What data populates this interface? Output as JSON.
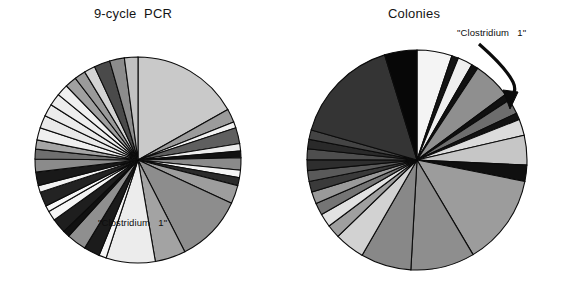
{
  "figure": {
    "background": "#ffffff",
    "stroke_color": "#0b0b0b",
    "width": 563,
    "height": 287
  },
  "panels": {
    "left": {
      "title": "9-cycle  PCR",
      "highlight_label": "\"Clostridium   1\""
    },
    "right": {
      "title": "Colonies",
      "highlight_label": "\"Clostridium   1\"",
      "annotation_arrow": "curved-arrow-icon"
    }
  },
  "chart_data": [
    {
      "type": "pie",
      "title": "9-cycle  PCR",
      "panel": "left",
      "center": [
        138,
        160
      ],
      "radius": 103,
      "start_angle_deg": -90,
      "direction": "clockwise",
      "annotations": [
        {
          "text": "\"Clostridium   1\"",
          "target_slice": "Clostridium 1",
          "x": 155,
          "y": 228
        }
      ],
      "legend": "none",
      "grid": false,
      "slices": [
        {
          "label": "Clostridium 1",
          "value": 17.5,
          "color": "#c9c9c9"
        },
        {
          "label": "clone 2",
          "value": 2.2,
          "color": "#9b9b9b"
        },
        {
          "label": "clone 3",
          "value": 1.0,
          "color": "#f2f2f2"
        },
        {
          "label": "clone 4",
          "value": 2.6,
          "color": "#5f5f5f"
        },
        {
          "label": "clone 5",
          "value": 1.2,
          "color": "#ededed"
        },
        {
          "label": "clone 6",
          "value": 1.1,
          "color": "#121212"
        },
        {
          "label": "clone 7",
          "value": 2.0,
          "color": "#8a8a8a"
        },
        {
          "label": "clone 8",
          "value": 1.2,
          "color": "#f4f4f4"
        },
        {
          "label": "clone 9",
          "value": 1.3,
          "color": "#2b2b2b"
        },
        {
          "label": "clone 10",
          "value": 3.0,
          "color": "#9d9d9d"
        },
        {
          "label": "clone 11",
          "value": 11.0,
          "color": "#8d8d8d"
        },
        {
          "label": "clone 12",
          "value": 5.0,
          "color": "#a3a3a3"
        },
        {
          "label": "clone 13",
          "value": 8.0,
          "color": "#ececec"
        },
        {
          "label": "clone 14",
          "value": 1.2,
          "color": "#f6f6f6"
        },
        {
          "label": "clone 15",
          "value": 2.6,
          "color": "#1b1b1b"
        },
        {
          "label": "clone 16",
          "value": 3.2,
          "color": "#8f8f8f"
        },
        {
          "label": "clone 17",
          "value": 1.1,
          "color": "#111111"
        },
        {
          "label": "clone 18",
          "value": 2.4,
          "color": "#1e1e1e"
        },
        {
          "label": "clone 19",
          "value": 1.6,
          "color": "#f5f5f5"
        },
        {
          "label": "clone 20",
          "value": 1.0,
          "color": "#f7f7f7"
        },
        {
          "label": "clone 21",
          "value": 2.4,
          "color": "#232323"
        },
        {
          "label": "clone 22",
          "value": 1.1,
          "color": "#f2f2f2"
        },
        {
          "label": "clone 23",
          "value": 2.2,
          "color": "#191919"
        },
        {
          "label": "clone 24",
          "value": 2.1,
          "color": "#8b8b8b"
        },
        {
          "label": "clone 25",
          "value": 1.6,
          "color": "#6f6f6f"
        },
        {
          "label": "clone 26",
          "value": 1.5,
          "color": "#a5a5a5"
        },
        {
          "label": "clone 27",
          "value": 2.0,
          "color": "#efefef"
        },
        {
          "label": "clone 28",
          "value": 2.1,
          "color": "#e9e9e9"
        },
        {
          "label": "clone 29",
          "value": 2.0,
          "color": "#ebebeb"
        },
        {
          "label": "clone 30",
          "value": 2.0,
          "color": "#ededed"
        },
        {
          "label": "clone 31",
          "value": 1.9,
          "color": "#f0f0f0"
        },
        {
          "label": "clone 32",
          "value": 1.9,
          "color": "#a0a0a0"
        },
        {
          "label": "clone 33",
          "value": 1.8,
          "color": "#9a9a9a"
        },
        {
          "label": "clone 34",
          "value": 1.8,
          "color": "#d3d3d3"
        },
        {
          "label": "clone 35",
          "value": 2.6,
          "color": "#4a4a4a"
        },
        {
          "label": "clone 36",
          "value": 2.4,
          "color": "#8c8c8c"
        },
        {
          "label": "clone 37",
          "value": 2.2,
          "color": "#c2c2c2"
        }
      ]
    },
    {
      "type": "pie",
      "title": "Colonies",
      "panel": "right",
      "center": [
        417,
        160
      ],
      "radius": 110,
      "start_angle_deg": -90,
      "direction": "clockwise",
      "annotations": [
        {
          "text": "\"Clostridium   1\"",
          "target_slice": "Clostridium 1",
          "x": 500,
          "y": 33
        }
      ],
      "legend": "none",
      "grid": false,
      "slices": [
        {
          "label": "clone A",
          "value": 5.2,
          "color": "#f4f4f4"
        },
        {
          "label": "clone B",
          "value": 1.0,
          "color": "#141414"
        },
        {
          "label": "clone C",
          "value": 2.2,
          "color": "#efefef"
        },
        {
          "label": "clone D",
          "value": 1.0,
          "color": "#111111"
        },
        {
          "label": "clone E",
          "value": 5.6,
          "color": "#8f8f8f"
        },
        {
          "label": "clone F",
          "value": 1.0,
          "color": "#101010"
        },
        {
          "label": "clone G",
          "value": 2.2,
          "color": "#6d6d6d"
        },
        {
          "label": "clone H",
          "value": 1.0,
          "color": "#121212"
        },
        {
          "label": "clone I",
          "value": 2.4,
          "color": "#dcdcdc"
        },
        {
          "label": "Clostridium 1",
          "value": 4.4,
          "color": "#c6c6c6"
        },
        {
          "label": "clone K",
          "value": 2.4,
          "color": "#101010"
        },
        {
          "label": "clone L",
          "value": 13.5,
          "color": "#9c9c9c"
        },
        {
          "label": "clone M",
          "value": 9.5,
          "color": "#8e8e8e"
        },
        {
          "label": "clone N",
          "value": 7.5,
          "color": "#888888"
        },
        {
          "label": "clone O",
          "value": 4.5,
          "color": "#d2d2d2"
        },
        {
          "label": "clone P",
          "value": 2.0,
          "color": "#9f9f9f"
        },
        {
          "label": "clone Q",
          "value": 2.0,
          "color": "#e2e2e2"
        },
        {
          "label": "clone R",
          "value": 1.8,
          "color": "#757575"
        },
        {
          "label": "clone S",
          "value": 1.8,
          "color": "#9a9a9a"
        },
        {
          "label": "clone T",
          "value": 1.6,
          "color": "#3a3a3a"
        },
        {
          "label": "clone U",
          "value": 1.6,
          "color": "#5a5a5a"
        },
        {
          "label": "clone V",
          "value": 1.6,
          "color": "#2e2e2e"
        },
        {
          "label": "clone W",
          "value": 1.6,
          "color": "#4e4e4e"
        },
        {
          "label": "clone X",
          "value": 1.4,
          "color": "#2a2a2a"
        },
        {
          "label": "clone Y",
          "value": 1.4,
          "color": "#444444"
        },
        {
          "label": "clone Z",
          "value": 16.0,
          "color": "#343434"
        },
        {
          "label": "clone AA",
          "value": 4.8,
          "color": "#070707"
        }
      ]
    }
  ]
}
